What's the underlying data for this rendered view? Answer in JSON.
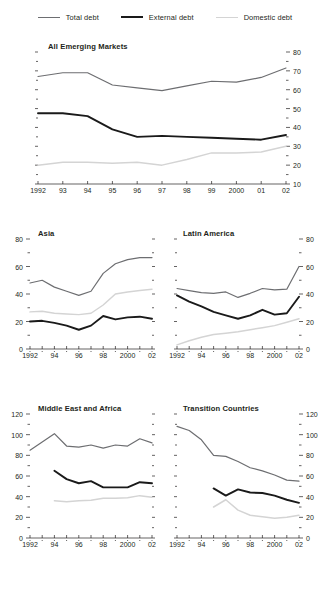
{
  "legend": {
    "items": [
      {
        "label": "Total debt",
        "key": "total",
        "color": "#6d6e71"
      },
      {
        "label": "External debt",
        "key": "external",
        "color": "#1a1a1a"
      },
      {
        "label": "Domestic debt",
        "key": "domestic",
        "color": "#d4d4d4"
      }
    ]
  },
  "colors": {
    "total": "#6d6e71",
    "external": "#1a1a1a",
    "domestic": "#d4d4d4",
    "axis": "#231f20"
  },
  "chart_data": [
    {
      "type": "line",
      "title": "All Emerging Markets",
      "panel": "all-emerging-markets",
      "x": [
        1992,
        1993,
        1994,
        1995,
        1996,
        1997,
        1998,
        1999,
        2000,
        2001,
        2002
      ],
      "xtick_labels": [
        "1992",
        "93",
        "94",
        "95",
        "96",
        "97",
        "98",
        "99",
        "2000",
        "01",
        "02"
      ],
      "ylim": [
        10,
        80
      ],
      "yticks": [
        10,
        20,
        30,
        40,
        50,
        60,
        70,
        80
      ],
      "ytick_labels": [
        "10",
        "20",
        "30",
        "40",
        "50",
        "60",
        "70",
        "80"
      ],
      "yaxis_side": "right",
      "minor_ticks": true,
      "grid": false,
      "xlabel": "",
      "ylabel": "",
      "series": [
        {
          "name": "Total debt",
          "key": "total",
          "values": [
            67.0,
            69.0,
            69.0,
            62.5,
            61.0,
            59.5,
            62.0,
            64.5,
            64.0,
            66.5,
            71.5
          ]
        },
        {
          "name": "External debt",
          "key": "external",
          "values": [
            47.5,
            47.5,
            46.0,
            39.0,
            35.0,
            35.5,
            35.0,
            34.5,
            34.0,
            33.5,
            36.0
          ]
        },
        {
          "name": "Domestic debt",
          "key": "domestic",
          "values": [
            20.0,
            21.5,
            21.5,
            21.0,
            21.5,
            20.0,
            23.0,
            26.5,
            26.5,
            27.0,
            30.0
          ]
        }
      ]
    },
    {
      "type": "line",
      "title": "Asia",
      "panel": "asia",
      "x": [
        1992,
        1993,
        1994,
        1995,
        1996,
        1997,
        1998,
        1999,
        2000,
        2001,
        2002
      ],
      "xtick_labels": [
        "1992",
        "94",
        "96",
        "98",
        "2000",
        "02"
      ],
      "xtick_values": [
        1992,
        1994,
        1996,
        1998,
        2000,
        2002
      ],
      "ylim": [
        0,
        80
      ],
      "yticks": [
        0,
        20,
        40,
        60,
        80
      ],
      "ytick_labels": [
        "0",
        "20",
        "40",
        "60",
        "80"
      ],
      "yaxis_side": "left",
      "minor_ticks": true,
      "grid": false,
      "xlabel": "",
      "ylabel": "",
      "series": [
        {
          "name": "Total debt",
          "key": "total",
          "values": [
            48.0,
            50.0,
            45.0,
            42.0,
            39.0,
            42.0,
            55.0,
            62.0,
            65.0,
            66.5,
            66.5
          ]
        },
        {
          "name": "External debt",
          "key": "external",
          "values": [
            20.0,
            20.5,
            19.0,
            17.0,
            14.0,
            17.0,
            24.0,
            21.5,
            23.0,
            23.5,
            22.0
          ]
        },
        {
          "name": "Domestic debt",
          "key": "domestic",
          "values": [
            27.0,
            27.5,
            26.0,
            25.5,
            25.0,
            26.0,
            32.0,
            40.0,
            41.5,
            42.5,
            43.5
          ]
        }
      ]
    },
    {
      "type": "line",
      "title": "Latin America",
      "panel": "latin-america",
      "x": [
        1992,
        1993,
        1994,
        1995,
        1996,
        1997,
        1998,
        1999,
        2000,
        2001,
        2002
      ],
      "xtick_labels": [
        "1992",
        "94",
        "96",
        "98",
        "2000",
        "02"
      ],
      "xtick_values": [
        1992,
        1994,
        1996,
        1998,
        2000,
        2002
      ],
      "ylim": [
        0,
        80
      ],
      "yticks": [
        0,
        20,
        40,
        60,
        80
      ],
      "ytick_labels": [
        "0",
        "20",
        "40",
        "60",
        "80"
      ],
      "yaxis_side": "right",
      "minor_ticks": true,
      "grid": false,
      "xlabel": "",
      "ylabel": "",
      "series": [
        {
          "name": "Total debt",
          "key": "total",
          "values": [
            44.0,
            42.5,
            41.0,
            40.5,
            41.5,
            37.5,
            40.5,
            44.0,
            43.0,
            43.5,
            60.0
          ]
        },
        {
          "name": "External debt",
          "key": "external",
          "values": [
            39.0,
            34.5,
            31.0,
            27.0,
            24.5,
            22.0,
            24.5,
            28.5,
            25.0,
            26.0,
            38.0
          ]
        },
        {
          "name": "Domestic debt",
          "key": "domestic",
          "values": [
            3.0,
            6.0,
            8.5,
            10.5,
            11.5,
            12.5,
            14.0,
            15.5,
            17.0,
            19.5,
            22.0
          ]
        }
      ]
    },
    {
      "type": "line",
      "title": "Middle East and Africa",
      "panel": "middle-east-and-africa",
      "x": [
        1992,
        1993,
        1994,
        1995,
        1996,
        1997,
        1998,
        1999,
        2000,
        2001,
        2002
      ],
      "xtick_labels": [
        "1992",
        "94",
        "96",
        "98",
        "2000",
        "02"
      ],
      "xtick_values": [
        1992,
        1994,
        1996,
        1998,
        2000,
        2002
      ],
      "ylim": [
        0,
        120
      ],
      "yticks": [
        0,
        20,
        40,
        60,
        80,
        100,
        120
      ],
      "ytick_labels": [
        "0",
        "20",
        "40",
        "60",
        "80",
        "100",
        "120"
      ],
      "yaxis_side": "left",
      "minor_ticks": true,
      "grid": false,
      "xlabel": "",
      "ylabel": "",
      "series": [
        {
          "name": "Total debt",
          "key": "total",
          "values": [
            85.0,
            93.0,
            101.0,
            89.0,
            88.0,
            90.0,
            87.0,
            90.0,
            89.0,
            96.0,
            92.0
          ]
        },
        {
          "name": "External debt",
          "key": "external",
          "values": [
            null,
            null,
            65.0,
            57.0,
            53.0,
            55.0,
            49.0,
            49.0,
            49.0,
            54.0,
            53.0
          ]
        },
        {
          "name": "Domestic debt",
          "key": "domestic",
          "values": [
            null,
            null,
            36.0,
            35.0,
            36.0,
            36.5,
            38.5,
            38.5,
            39.0,
            41.0,
            39.5
          ]
        }
      ]
    },
    {
      "type": "line",
      "title": "Transition Countries",
      "panel": "transition-countries",
      "x": [
        1992,
        1993,
        1994,
        1995,
        1996,
        1997,
        1998,
        1999,
        2000,
        2001,
        2002
      ],
      "xtick_labels": [
        "1992",
        "94",
        "96",
        "98",
        "2000",
        "02"
      ],
      "xtick_values": [
        1992,
        1994,
        1996,
        1998,
        2000,
        2002
      ],
      "ylim": [
        0,
        120
      ],
      "yticks": [
        0,
        20,
        40,
        60,
        80,
        100,
        120
      ],
      "ytick_labels": [
        "0",
        "20",
        "40",
        "60",
        "80",
        "100",
        "120"
      ],
      "yaxis_side": "right",
      "minor_ticks": true,
      "grid": false,
      "xlabel": "",
      "ylabel": "",
      "series": [
        {
          "name": "Total debt",
          "key": "total",
          "values": [
            108.0,
            104.0,
            95.0,
            80.0,
            79.0,
            74.0,
            68.0,
            65.0,
            61.0,
            56.0,
            55.0
          ]
        },
        {
          "name": "External debt",
          "key": "external",
          "values": [
            null,
            null,
            null,
            48.0,
            41.0,
            47.0,
            44.0,
            43.5,
            41.0,
            37.0,
            34.0
          ]
        },
        {
          "name": "Domestic debt",
          "key": "domestic",
          "values": [
            null,
            null,
            null,
            30.0,
            37.0,
            27.0,
            22.0,
            20.5,
            19.0,
            20.0,
            22.0
          ]
        }
      ]
    }
  ]
}
